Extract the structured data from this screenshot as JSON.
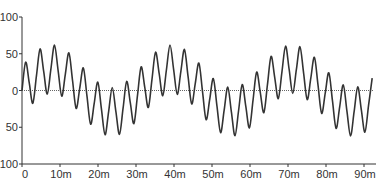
{
  "chart_data": {
    "type": "line",
    "title": "",
    "xlabel": "",
    "ylabel": "",
    "xlim": [
      0,
      92.5
    ],
    "ylim": [
      -100,
      100
    ],
    "grid": false,
    "legend": null,
    "x_ticks": [
      {
        "value": 0,
        "label": "0"
      },
      {
        "value": 10,
        "label": "10m"
      },
      {
        "value": 20,
        "label": "20m"
      },
      {
        "value": 30,
        "label": "30m"
      },
      {
        "value": 40,
        "label": "40m"
      },
      {
        "value": 50,
        "label": "50m"
      },
      {
        "value": 60,
        "label": "60m"
      },
      {
        "value": 70,
        "label": "70m"
      },
      {
        "value": 80,
        "label": "80m"
      },
      {
        "value": 90,
        "label": "90m"
      }
    ],
    "y_ticks": [
      {
        "value": 100,
        "label": "100"
      },
      {
        "value": 50,
        "label": "50"
      },
      {
        "value": 0,
        "label": "0"
      },
      {
        "value": -50,
        "label": "50"
      },
      {
        "value": -100,
        "label": "100"
      }
    ],
    "reference_line": {
      "y": 0,
      "style": "dotted"
    },
    "series": [
      {
        "name": "signal",
        "color": "#333333",
        "x_step": 0.95,
        "x_start": 0,
        "values": [
          0,
          38.5,
          10.7,
          -17.4,
          19.9,
          56.5,
          26.3,
          -4.9,
          29.0,
          61.7,
          27.5,
          -7.7,
          22.1,
          51.2,
          13.6,
          -24.4,
          3.2,
          30.7,
          -7.7,
          -45.8,
          -17.6,
          11.4,
          -24.9,
          -60.2,
          -28.6,
          4.0,
          -28.3,
          -59.7,
          -24.1,
          12.3,
          -16.6,
          -45.0,
          -6.3,
          32.1,
          4.6,
          -23.1,
          14.9,
          52.1,
          23.0,
          -7.1,
          27.9,
          61.9,
          28.8,
          -5.2,
          25.8,
          55.8,
          19.1,
          -18.3,
          9.7,
          37.3,
          -1.2,
          -39.7,
          -11.9,
          16.3,
          -20.9,
          -57.3,
          -26.8,
          4.6,
          -29.0,
          -61.5,
          -27.2,
          8.1,
          -21.7,
          -50.8,
          -13.1,
          25.0,
          -2.6,
          -30.1,
          8.3,
          46.4,
          18.0,
          -11.0,
          25.1,
          60.3,
          28.6,
          -4.0,
          28.3,
          59.6,
          24.1,
          -12.3,
          16.7,
          45.2,
          7.3,
          -31.1,
          -3.5,
          24.1,
          -13.9,
          -51.5,
          -22.3,
          7.6,
          -27.6,
          -61.8,
          -28.9,
          4.9,
          -26.4,
          -56.7,
          -20.3,
          16.8
        ]
      }
    ]
  }
}
